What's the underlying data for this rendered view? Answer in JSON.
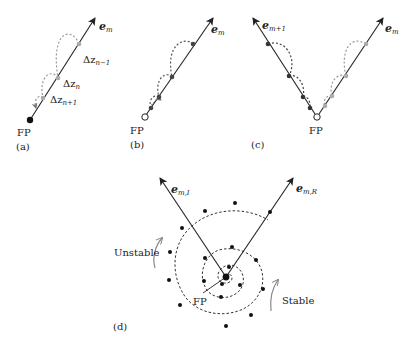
{
  "figure": {
    "panels": [
      {
        "id": "a",
        "caption": "(a)",
        "fixed_point_label": "FP",
        "fixed_point_style": "filled",
        "axis_label": "e",
        "axis_sub": "m",
        "steps": [
          {
            "label": "Δz",
            "sub": "n−1"
          },
          {
            "label": "Δz",
            "sub": "n"
          },
          {
            "label": "Δz",
            "sub": "n+1"
          }
        ]
      },
      {
        "id": "b",
        "caption": "(b)",
        "fixed_point_label": "FP",
        "fixed_point_style": "open",
        "axis_label": "e",
        "axis_sub": "m"
      },
      {
        "id": "c",
        "caption": "(c)",
        "fixed_point_label": "FP",
        "fixed_point_style": "open",
        "axis_left_label": "e",
        "axis_left_sub": "m+1",
        "axis_right_label": "e",
        "axis_right_sub": "m"
      },
      {
        "id": "d",
        "caption": "(d)",
        "fixed_point_label": "FP",
        "axis_left_label": "e",
        "axis_left_sub": "m,I",
        "axis_right_label": "e",
        "axis_right_sub": "m,R",
        "unstable_label": "Unstable",
        "stable_label": "Stable"
      }
    ],
    "colors": {
      "line": "#222222",
      "dashed_dark": "#444444",
      "dashed_light": "#9a9a9a",
      "arrow_gray": "#888888"
    }
  }
}
